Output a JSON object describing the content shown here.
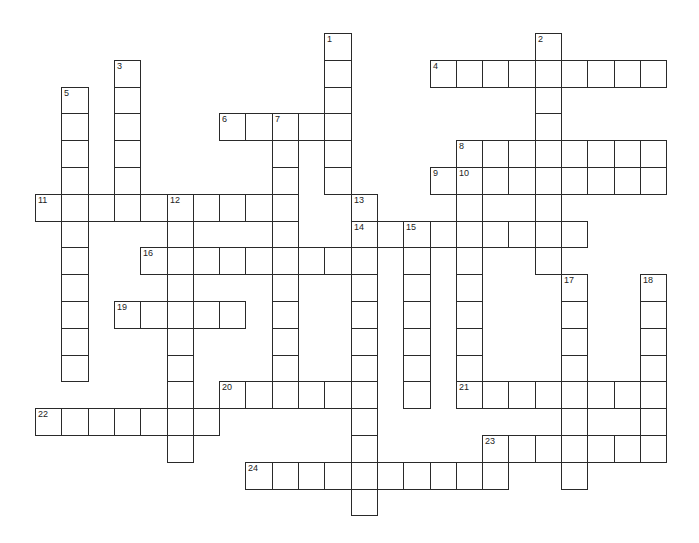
{
  "puzzle": {
    "origin_x": 35,
    "origin_y": 33,
    "cell_w": 26.3,
    "cell_h": 26.8,
    "entries": [
      {
        "number": "1",
        "dir": "down",
        "col": 11,
        "row": 0,
        "length": 6
      },
      {
        "number": "2",
        "dir": "down",
        "col": 19,
        "row": 0,
        "length": 9
      },
      {
        "number": "3",
        "dir": "down",
        "col": 3,
        "row": 1,
        "length": 6
      },
      {
        "number": "4",
        "dir": "across",
        "col": 15,
        "row": 1,
        "length": 9
      },
      {
        "number": "5",
        "dir": "down",
        "col": 1,
        "row": 2,
        "length": 11
      },
      {
        "number": "6",
        "dir": "across",
        "col": 7,
        "row": 3,
        "length": 5
      },
      {
        "number": "7",
        "dir": "down",
        "col": 9,
        "row": 3,
        "length": 11
      },
      {
        "number": "8",
        "dir": "across",
        "col": 16,
        "row": 4,
        "length": 8
      },
      {
        "number": "9",
        "dir": "across",
        "col": 15,
        "row": 5,
        "length": 9
      },
      {
        "number": "10",
        "dir": "down",
        "col": 16,
        "row": 5,
        "length": 9
      },
      {
        "number": "11",
        "dir": "across",
        "col": 0,
        "row": 6,
        "length": 10
      },
      {
        "number": "12",
        "dir": "down",
        "col": 5,
        "row": 6,
        "length": 10
      },
      {
        "number": "13",
        "dir": "down",
        "col": 12,
        "row": 6,
        "length": 12
      },
      {
        "number": "14",
        "dir": "across",
        "col": 12,
        "row": 7,
        "length": 9
      },
      {
        "number": "15",
        "dir": "down",
        "col": 14,
        "row": 7,
        "length": 7
      },
      {
        "number": "16",
        "dir": "across",
        "col": 4,
        "row": 8,
        "length": 9
      },
      {
        "number": "17",
        "dir": "down",
        "col": 20,
        "row": 9,
        "length": 8
      },
      {
        "number": "18",
        "dir": "down",
        "col": 23,
        "row": 9,
        "length": 7
      },
      {
        "number": "19",
        "dir": "across",
        "col": 3,
        "row": 10,
        "length": 5
      },
      {
        "number": "20",
        "dir": "across",
        "col": 7,
        "row": 13,
        "length": 6
      },
      {
        "number": "21",
        "dir": "across",
        "col": 16,
        "row": 13,
        "length": 8
      },
      {
        "number": "22",
        "dir": "across",
        "col": 0,
        "row": 14,
        "length": 7
      },
      {
        "number": "23",
        "dir": "across",
        "col": 17,
        "row": 15,
        "length": 7
      },
      {
        "number": "24",
        "dir": "across",
        "col": 8,
        "row": 16,
        "length": 10
      }
    ]
  }
}
